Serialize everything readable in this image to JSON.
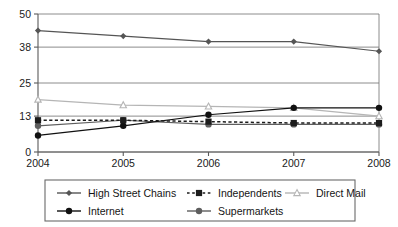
{
  "chart_data": {
    "type": "line",
    "title": "",
    "subtitle": "",
    "xlabel": "",
    "ylabel": "",
    "categories": [
      "2004",
      "2005",
      "2006",
      "2007",
      "2008"
    ],
    "x_tick_labels": [
      "2004",
      "2005",
      "2006",
      "2007",
      "2008"
    ],
    "y_tick_labels": [
      "0",
      "13",
      "25",
      "38",
      "50"
    ],
    "y_tick_values": [
      0,
      13,
      25,
      38,
      50
    ],
    "ylim": [
      0,
      50
    ],
    "grid": true,
    "grid_axis": "y",
    "legend_position": "bottom",
    "series": [
      {
        "name": "High Street Chains",
        "marker": "diamond",
        "color": "#555555",
        "line_style": "solid",
        "values": [
          44,
          42,
          40,
          40,
          36.5
        ]
      },
      {
        "name": "Independents",
        "marker": "square",
        "color": "#1c1c1c",
        "line_style": "dashed",
        "values": [
          11.5,
          11.5,
          11,
          10.5,
          10.5
        ]
      },
      {
        "name": "Direct Mail",
        "marker": "triangle",
        "color": "#b5b5b5",
        "line_style": "solid",
        "values": [
          19,
          17,
          16.5,
          16,
          13
        ]
      },
      {
        "name": "Internet",
        "marker": "circle",
        "color": "#111111",
        "line_style": "solid",
        "values": [
          6,
          9.5,
          13.5,
          16,
          16
        ]
      },
      {
        "name": "Supermarkets",
        "marker": "circle",
        "color": "#5e5e5e",
        "line_style": "solid",
        "values": [
          9.5,
          11.5,
          10,
          10,
          10
        ]
      }
    ]
  },
  "legend": {
    "entries": [
      {
        "label": "High Street Chains"
      },
      {
        "label": "Independents"
      },
      {
        "label": "Direct Mail"
      },
      {
        "label": "Internet"
      },
      {
        "label": "Supermarkets"
      }
    ]
  },
  "colors": {
    "high_street_chains": "#555555",
    "independents": "#1c1c1c",
    "direct_mail": "#b5b5b5",
    "internet": "#111111",
    "supermarkets": "#5e5e5e",
    "axis": "#5a5a5a",
    "grid": "#6e6e6e",
    "text": "#141414",
    "background": "#ffffff"
  }
}
